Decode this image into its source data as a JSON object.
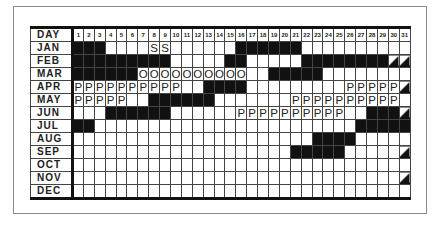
{
  "header_label": "DAY",
  "days": [
    "1",
    "2",
    "3",
    "4",
    "5",
    "6",
    "7",
    "8",
    "9",
    "10",
    "11",
    "12",
    "13",
    "14",
    "15",
    "16",
    "17",
    "18",
    "19",
    "20",
    "21",
    "22",
    "23",
    "24",
    "25",
    "26",
    "27",
    "28",
    "29",
    "30",
    "31"
  ],
  "legend_marks": {
    "S": "S",
    "O": "O",
    "P": "P"
  },
  "months": [
    {
      "label": "JAN",
      "black": [
        [
          1,
          3
        ],
        [
          16,
          21
        ]
      ],
      "marks": {
        "8": "S",
        "9": "S"
      },
      "slash": []
    },
    {
      "label": "FEB",
      "black": [
        [
          1,
          9
        ],
        [
          15,
          16
        ],
        [
          22,
          29
        ]
      ],
      "marks": {},
      "slash": [
        30,
        31
      ]
    },
    {
      "label": "MAR",
      "black": [
        [
          1,
          6
        ],
        [
          19,
          23
        ]
      ],
      "marks": {
        "7": "O",
        "8": "O",
        "9": "O",
        "10": "O",
        "11": "O",
        "12": "O",
        "13": "O",
        "14": "O",
        "15": "O",
        "16": "O"
      },
      "slash": []
    },
    {
      "label": "APR",
      "black": [
        [
          13,
          16
        ]
      ],
      "marks": {
        "1": "P",
        "2": "P",
        "3": "P",
        "4": "P",
        "5": "P",
        "6": "P",
        "7": "P",
        "8": "P",
        "9": "P",
        "10": "P",
        "26": "P",
        "27": "P",
        "28": "P",
        "29": "P",
        "30": "P"
      },
      "slash": [
        31
      ]
    },
    {
      "label": "MAY",
      "black": [
        [
          8,
          13
        ]
      ],
      "marks": {
        "1": "P",
        "2": "P",
        "3": "P",
        "4": "P",
        "5": "P",
        "21": "P",
        "22": "P",
        "23": "P",
        "24": "P",
        "25": "P",
        "26": "P",
        "27": "P",
        "28": "P",
        "29": "P",
        "30": "P"
      },
      "slash": []
    },
    {
      "label": "JUN",
      "black": [
        [
          4,
          9
        ],
        [
          28,
          30
        ]
      ],
      "marks": {
        "16": "P",
        "17": "P",
        "18": "P",
        "19": "P",
        "20": "P",
        "21": "P",
        "22": "P",
        "23": "P",
        "24": "P",
        "25": "P"
      },
      "slash": [
        31
      ]
    },
    {
      "label": "JUL",
      "black": [
        [
          1,
          2
        ],
        [
          27,
          31
        ]
      ],
      "marks": {},
      "slash": []
    },
    {
      "label": "AUG",
      "black": [
        [
          23,
          26
        ]
      ],
      "marks": {},
      "slash": []
    },
    {
      "label": "SEP",
      "black": [
        [
          21,
          25
        ]
      ],
      "marks": {},
      "slash": [
        31
      ]
    },
    {
      "label": "OCT",
      "black": [],
      "marks": {},
      "slash": []
    },
    {
      "label": "NOV",
      "black": [],
      "marks": {},
      "slash": [
        31
      ]
    },
    {
      "label": "DEC",
      "black": [],
      "marks": {},
      "slash": []
    }
  ]
}
